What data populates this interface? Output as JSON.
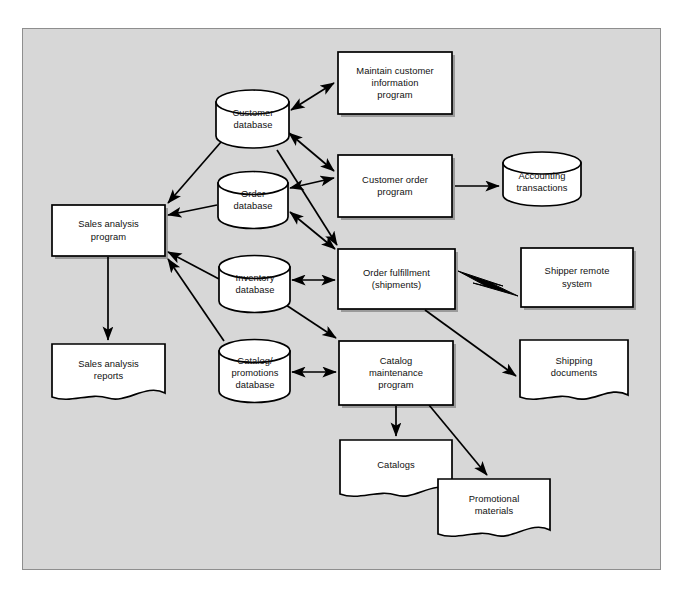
{
  "diagram": {
    "background_color": "#d7d7d7",
    "frame_border_color": "#8e8e8e",
    "shape_fill": "#ffffff",
    "shape_stroke": "#000000",
    "nodes": [
      {
        "id": "customer_database",
        "label": "Customer\ndatabase",
        "shape": "cylinder",
        "x": 216,
        "y": 90,
        "w": 73,
        "h": 58
      },
      {
        "id": "maintain_customer_information_program",
        "label": "Maintain customer\ninformation\nprogram",
        "shape": "process",
        "x": 338,
        "y": 52,
        "w": 114,
        "h": 62
      },
      {
        "id": "order_database",
        "label": "Order\ndatabase",
        "shape": "cylinder",
        "x": 218,
        "y": 172,
        "w": 70,
        "h": 56
      },
      {
        "id": "customer_order_program",
        "label": "Customer order\nprogram",
        "shape": "process",
        "x": 338,
        "y": 155,
        "w": 114,
        "h": 62
      },
      {
        "id": "accounting_transactions",
        "label": "Accounting\ntransactions",
        "shape": "cylinder",
        "x": 503,
        "y": 152,
        "w": 78,
        "h": 54
      },
      {
        "id": "sales_analysis_program",
        "label": "Sales analysis\nprogram",
        "shape": "process",
        "x": 52,
        "y": 205,
        "w": 113,
        "h": 51
      },
      {
        "id": "inventory_database",
        "label": "Inventory\ndatabase",
        "shape": "cylinder",
        "x": 219,
        "y": 256,
        "w": 71,
        "h": 56
      },
      {
        "id": "order_fulfillment_shipments",
        "label": "Order fulfillment\n(shipments)",
        "shape": "process",
        "x": 338,
        "y": 249,
        "w": 117,
        "h": 60
      },
      {
        "id": "shipper_remote_system",
        "label": "Shipper remote\nsystem",
        "shape": "process",
        "x": 521,
        "y": 248,
        "w": 112,
        "h": 59
      },
      {
        "id": "catalog_promotions_database",
        "label": "Catalog/\npromotions\ndatabase",
        "shape": "cylinder",
        "x": 219,
        "y": 340,
        "w": 71,
        "h": 62
      },
      {
        "id": "catalog_maintenance_program",
        "label": "Catalog\nmaintenance\nprogram",
        "shape": "process",
        "x": 339,
        "y": 341,
        "w": 114,
        "h": 64
      },
      {
        "id": "sales_analysis_reports",
        "label": "Sales analysis\nreports",
        "shape": "document",
        "x": 52,
        "y": 344,
        "w": 113,
        "h": 62
      },
      {
        "id": "shipping_documents",
        "label": "Shipping\ndocuments",
        "shape": "document",
        "x": 520,
        "y": 340,
        "w": 108,
        "h": 66
      },
      {
        "id": "catalogs",
        "label": "Catalogs",
        "shape": "document",
        "x": 340,
        "y": 440,
        "w": 112,
        "h": 63
      },
      {
        "id": "promotional_materials",
        "label": "Promotional\nmaterials",
        "shape": "document",
        "x": 438,
        "y": 479,
        "w": 112,
        "h": 64
      }
    ],
    "connectors": [
      {
        "id": "customer-db-to-maintain-program",
        "type": "double-arrow",
        "from": "customer_database",
        "to": "maintain_customer_information_program"
      },
      {
        "id": "customer-db-to-customer-order-program",
        "type": "double-arrow",
        "from": "customer_database",
        "to": "customer_order_program"
      },
      {
        "id": "customer-db-to-order-fulfillment",
        "type": "single-arrow",
        "from": "customer_database",
        "to": "order_fulfillment_shipments"
      },
      {
        "id": "customer-db-to-sales-analysis",
        "type": "single-arrow",
        "from": "customer_database",
        "to": "sales_analysis_program"
      },
      {
        "id": "order-db-to-customer-order-program",
        "type": "double-arrow",
        "from": "order_database",
        "to": "customer_order_program"
      },
      {
        "id": "order-db-to-order-fulfillment",
        "type": "double-arrow",
        "from": "order_database",
        "to": "order_fulfillment_shipments"
      },
      {
        "id": "order-db-to-sales-analysis",
        "type": "single-arrow",
        "from": "order_database",
        "to": "sales_analysis_program"
      },
      {
        "id": "customer-order-program-to-accounting",
        "type": "single-arrow",
        "from": "customer_order_program",
        "to": "accounting_transactions"
      },
      {
        "id": "inventory-db-to-order-fulfillment",
        "type": "double-arrow",
        "from": "inventory_database",
        "to": "order_fulfillment_shipments"
      },
      {
        "id": "inventory-db-to-catalog-maintenance",
        "type": "single-arrow",
        "from": "inventory_database",
        "to": "catalog_maintenance_program"
      },
      {
        "id": "inventory-db-to-sales-analysis",
        "type": "single-arrow",
        "from": "inventory_database",
        "to": "sales_analysis_program"
      },
      {
        "id": "catalog-db-to-catalog-maintenance",
        "type": "double-arrow",
        "from": "catalog_promotions_database",
        "to": "catalog_maintenance_program"
      },
      {
        "id": "catalog-db-to-sales-analysis",
        "type": "single-arrow",
        "from": "catalog_promotions_database",
        "to": "sales_analysis_program"
      },
      {
        "id": "order-fulfillment-to-shipper-remote",
        "type": "lightning",
        "from": "order_fulfillment_shipments",
        "to": "shipper_remote_system"
      },
      {
        "id": "order-fulfillment-to-shipping-documents",
        "type": "single-arrow",
        "from": "order_fulfillment_shipments",
        "to": "shipping_documents"
      },
      {
        "id": "catalog-maintenance-to-catalogs",
        "type": "single-arrow",
        "from": "catalog_maintenance_program",
        "to": "catalogs"
      },
      {
        "id": "catalog-maintenance-to-promotional-materials",
        "type": "single-arrow",
        "from": "catalog_maintenance_program",
        "to": "promotional_materials"
      },
      {
        "id": "sales-analysis-to-reports",
        "type": "single-arrow",
        "from": "sales_analysis_program",
        "to": "sales_analysis_reports"
      }
    ]
  }
}
